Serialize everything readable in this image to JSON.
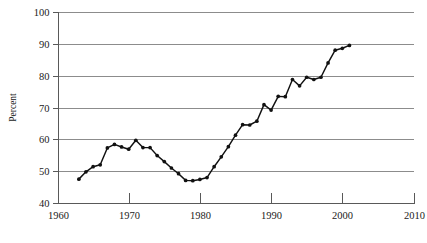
{
  "chart_data": {
    "type": "line",
    "title": "",
    "subtitle": "",
    "xlabel": "",
    "ylabel": "Percent",
    "xlim": [
      1960,
      2010
    ],
    "ylim": [
      40,
      100
    ],
    "xticks": [
      1960,
      1970,
      1980,
      1990,
      2000,
      2010
    ],
    "xtick_labels": [
      "1960",
      "1970",
      "1980",
      "1990",
      "2000",
      "2010"
    ],
    "yticks": [
      40,
      50,
      60,
      70,
      80,
      90,
      100
    ],
    "ytick_labels": [
      "40",
      "50",
      "60",
      "70",
      "80",
      "90",
      "100"
    ],
    "grid": "horizontal",
    "legend": "none",
    "marker": "filled-circle",
    "line_color": "#111111",
    "grid_color": "#8c8c8c",
    "axis_color": "#595959",
    "background": "#ffffff",
    "series": [
      {
        "name": "Percent",
        "x": [
          1963,
          1964,
          1965,
          1966,
          1967,
          1968,
          1969,
          1970,
          1971,
          1972,
          1973,
          1974,
          1975,
          1976,
          1977,
          1978,
          1979,
          1980,
          1981,
          1982,
          1983,
          1984,
          1985,
          1986,
          1987,
          1988,
          1989,
          1990,
          1991,
          1992,
          1993,
          1994,
          1995,
          1996,
          1997,
          1998,
          1999,
          2000,
          2001
        ],
        "values": [
          47.5,
          49.8,
          51.4,
          52.0,
          57.3,
          58.4,
          57.6,
          56.9,
          59.7,
          57.4,
          57.4,
          54.9,
          53.0,
          51.0,
          49.2,
          47.1,
          47.0,
          47.4,
          48.0,
          51.4,
          54.5,
          57.7,
          61.3,
          64.6,
          64.5,
          65.7,
          70.9,
          69.2,
          73.5,
          73.4,
          78.8,
          76.8,
          79.5,
          78.8,
          79.5,
          84.0,
          88.0,
          88.6,
          89.5
        ]
      }
    ]
  },
  "axes": {
    "y_axis_title": "Percent"
  }
}
